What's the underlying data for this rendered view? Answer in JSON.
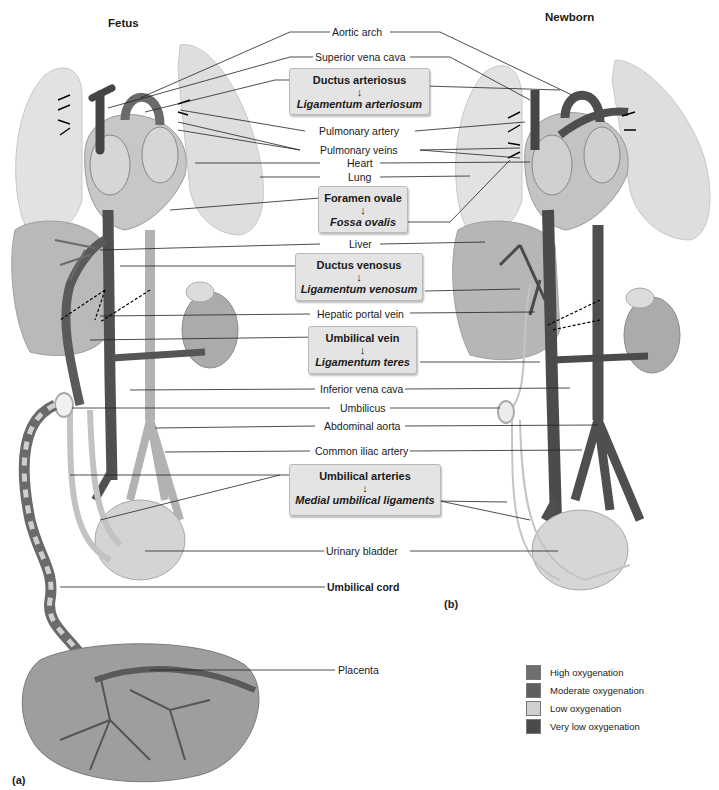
{
  "panels": {
    "fetus": {
      "header": "Fetus",
      "tag": "(a)"
    },
    "newborn": {
      "header": "Newborn",
      "tag": "(b)"
    }
  },
  "labels": {
    "aortic_arch": "Aortic arch",
    "superior_vena_cava": "Superior vena cava",
    "pulmonary_artery": "Pulmonary artery",
    "pulmonary_veins": "Pulmonary veins",
    "heart": "Heart",
    "lung": "Lung",
    "liver": "Liver",
    "hepatic_portal_vein": "Hepatic portal vein",
    "inferior_vena_cava": "Inferior vena cava",
    "umbilicus": "Umbilicus",
    "abdominal_aorta": "Abdominal aorta",
    "common_iliac_artery": "Common iliac artery",
    "urinary_bladder": "Urinary bladder",
    "umbilical_cord": "Umbilical cord",
    "placenta": "Placenta"
  },
  "transitions": [
    {
      "fetal": "Ductus arteriosus",
      "arrow": "↓",
      "adult": "Ligamentum arteriosum"
    },
    {
      "fetal": "Foramen ovale",
      "arrow": "↓",
      "adult": "Fossa ovalis"
    },
    {
      "fetal": "Ductus venosus",
      "arrow": "↓",
      "adult": "Ligamentum venosum"
    },
    {
      "fetal": "Umbilical vein",
      "arrow": "↓",
      "adult": "Ligamentum teres"
    },
    {
      "fetal": "Umbilical arteries",
      "arrow": "↓",
      "adult": "Medial umbilical ligaments"
    }
  ],
  "legend": {
    "items": [
      {
        "label": "High oxygenation",
        "color": "#6e6e6e"
      },
      {
        "label": "Moderate oxygenation",
        "color": "#5e5e5e"
      },
      {
        "label": "Low oxygenation",
        "color": "#cfcfcf"
      },
      {
        "label": "Very low oxygenation",
        "color": "#4a4a4a"
      }
    ]
  },
  "colors": {
    "lung": "#e3e3e3",
    "liver": "#b8b8b8",
    "vein_dark": "#4a4a4a",
    "artery_light": "#b0b0b0",
    "kidney": "#a9a9a9",
    "bladder": "#d6d6d6",
    "box_bg": "#e4e4e4"
  }
}
